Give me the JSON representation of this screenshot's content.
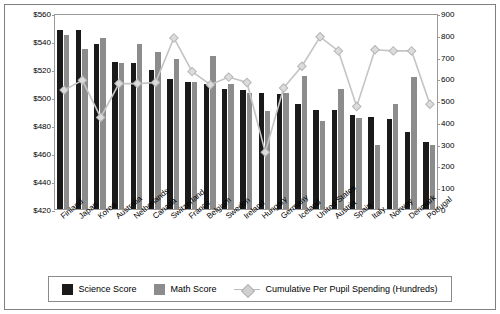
{
  "chart_data": {
    "type": "bar",
    "title": "",
    "xlabel": "",
    "ylabel": "",
    "ylim": [
      420,
      560
    ],
    "y2lim": [
      0,
      900
    ],
    "grid": false,
    "legend_position": "bottom",
    "categories": [
      "Finland",
      "Japan",
      "Korea",
      "Australia",
      "Netherlands",
      "Canada",
      "Switzerland",
      "France",
      "Belgium",
      "Sweden",
      "Ireland",
      "Hungary",
      "Germany",
      "Iceland",
      "United States",
      "Austria",
      "Spain",
      "Italy",
      "Norway",
      "Denmark",
      "Portugal"
    ],
    "ytick_labels": [
      "$420",
      "$440",
      "$460",
      "$480",
      "$500",
      "$520",
      "$540",
      "$560"
    ],
    "y2tick_labels": [
      "0",
      "100",
      "200",
      "300",
      "400",
      "500",
      "600",
      "700",
      "800",
      "900"
    ],
    "series": [
      {
        "name": "Science Score",
        "type": "bar",
        "color": "#1a1a1a",
        "values": [
          548,
          548,
          538,
          525,
          524,
          519,
          513,
          511,
          509,
          506,
          505,
          503,
          502,
          495,
          491,
          491,
          487,
          486,
          484,
          475,
          468
        ]
      },
      {
        "name": "Math Score",
        "type": "bar",
        "color": "#8c8c8c",
        "values": [
          544,
          534,
          542,
          524,
          538,
          532,
          527,
          511,
          529,
          509,
          503,
          490,
          503,
          515,
          483,
          506,
          485,
          466,
          495,
          514,
          466
        ]
      },
      {
        "name": "Cumulative Per Pupil Spending (Hundreds)",
        "type": "line",
        "color": "#c8c8c8",
        "values": [
          555,
          600,
          430,
          585,
          585,
          590,
          795,
          640,
          580,
          615,
          590,
          270,
          565,
          665,
          800,
          735,
          480,
          740,
          735,
          735,
          490
        ]
      }
    ]
  },
  "legend": {
    "items": [
      {
        "label": "Science Score"
      },
      {
        "label": "Math Score"
      },
      {
        "label": "Cumulative Per Pupil Spending (Hundreds)"
      }
    ]
  }
}
